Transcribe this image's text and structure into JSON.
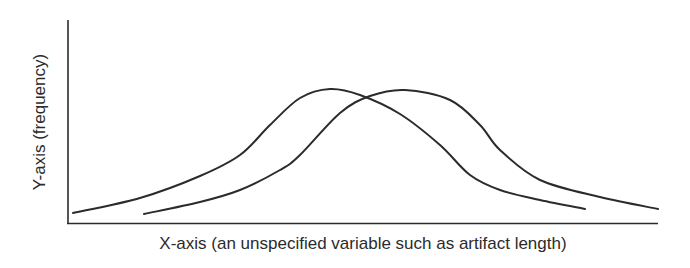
{
  "chart_data": {
    "type": "line",
    "title": "",
    "xlabel": "X-axis (an unspecified variable such as artifact length)",
    "ylabel": "Y-axis (frequency)",
    "grid": false,
    "legend": null,
    "ticks": false,
    "series": [
      {
        "name": "distribution-a",
        "description": "Left bell-shaped frequency curve",
        "points_px": [
          [
            73,
            213
          ],
          [
            140,
            198
          ],
          [
            200,
            176
          ],
          [
            240,
            155
          ],
          [
            270,
            125
          ],
          [
            300,
            98
          ],
          [
            330,
            89
          ],
          [
            360,
            95
          ],
          [
            400,
            114
          ],
          [
            440,
            145
          ],
          [
            470,
            175
          ],
          [
            500,
            190
          ],
          [
            540,
            200
          ],
          [
            585,
            209
          ]
        ]
      },
      {
        "name": "distribution-b",
        "description": "Right bell-shaped frequency curve, shifted right",
        "points_px": [
          [
            144,
            214
          ],
          [
            200,
            202
          ],
          [
            240,
            190
          ],
          [
            280,
            170
          ],
          [
            300,
            155
          ],
          [
            340,
            113
          ],
          [
            370,
            96
          ],
          [
            405,
            90
          ],
          [
            450,
            100
          ],
          [
            480,
            125
          ],
          [
            500,
            150
          ],
          [
            540,
            180
          ],
          [
            600,
            197
          ],
          [
            658,
            209
          ]
        ]
      }
    ],
    "axes_px": {
      "origin": [
        68,
        223
      ],
      "y_top": [
        68,
        20
      ],
      "x_end": [
        658,
        223
      ]
    }
  },
  "labels": {
    "x_axis": "X-axis (an unspecified variable such as artifact length)",
    "y_axis": "Y-axis (frequency)"
  }
}
